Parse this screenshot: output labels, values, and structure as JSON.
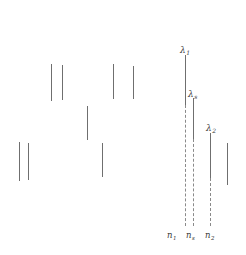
{
  "figure": {
    "type": "line-spectrum-diagram",
    "background_color": "#ffffff",
    "stroke_color": "#6f6f6f",
    "dashed_color": "#8a8a8a",
    "label_color": "#3a3a3a",
    "width": 246,
    "height": 255
  },
  "wavelength_labels": [
    {
      "symbol": "λ",
      "subscript": "1",
      "x": 180,
      "y": 46
    },
    {
      "symbol": "λ",
      "subscript": "s",
      "x": 188,
      "y": 90
    },
    {
      "symbol": "λ",
      "subscript": "2",
      "x": 206,
      "y": 124
    }
  ],
  "index_labels": [
    {
      "symbol": "n",
      "subscript": "1",
      "x": 167,
      "y": 231
    },
    {
      "symbol": "n",
      "subscript": "s",
      "x": 186,
      "y": 231
    },
    {
      "symbol": "n",
      "subscript": "2",
      "x": 205,
      "y": 231
    }
  ],
  "scatter_lines": [
    {
      "x": 51,
      "top": 64,
      "bottom": 101,
      "style": "solid"
    },
    {
      "x": 62,
      "top": 65,
      "bottom": 100,
      "style": "solid"
    },
    {
      "x": 113,
      "top": 64,
      "bottom": 99,
      "style": "solid"
    },
    {
      "x": 133,
      "top": 66,
      "bottom": 99,
      "style": "solid"
    },
    {
      "x": 87,
      "top": 106,
      "bottom": 140,
      "style": "solid"
    },
    {
      "x": 19,
      "top": 142,
      "bottom": 181,
      "style": "solid"
    },
    {
      "x": 28,
      "top": 143,
      "bottom": 180,
      "style": "solid"
    },
    {
      "x": 102,
      "top": 143,
      "bottom": 177,
      "style": "solid"
    }
  ],
  "channel_lines": [
    {
      "name": "lambda-1-solid",
      "x": 185,
      "top": 55,
      "bottom": 105,
      "style": "solid"
    },
    {
      "name": "lambda-1-dashed",
      "x": 185,
      "top": 105,
      "bottom": 226,
      "style": "dashed"
    },
    {
      "name": "lambda-s-solid",
      "x": 193,
      "top": 98,
      "bottom": 139,
      "style": "solid"
    },
    {
      "name": "lambda-s-dashed",
      "x": 193,
      "top": 139,
      "bottom": 226,
      "style": "dashed"
    },
    {
      "name": "lambda-2-solid",
      "x": 210,
      "top": 133,
      "bottom": 178,
      "style": "solid"
    },
    {
      "name": "lambda-2-dashed",
      "x": 210,
      "top": 178,
      "bottom": 226,
      "style": "dashed"
    },
    {
      "name": "right-edge-line",
      "x": 227,
      "top": 143,
      "bottom": 185,
      "style": "solid"
    }
  ]
}
